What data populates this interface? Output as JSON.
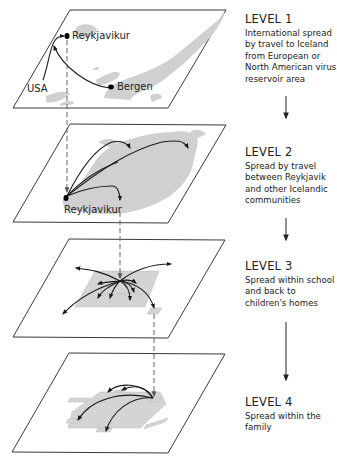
{
  "levels": [
    {
      "title": "LEVEL 1",
      "description": "International spread by travel to Iceland from European or North American virus reservoir area",
      "labels": {
        "reykjavik": "Reykjavikur",
        "usa": "USA",
        "bergen": "Bergen"
      }
    },
    {
      "title": "LEVEL 2",
      "description": "Spread by travel between Reykjavik and other Icelandic communities",
      "labels": {
        "reykjavik": "Reykjavikur"
      }
    },
    {
      "title": "LEVEL 3",
      "description": "Spread within school and back to children's homes"
    },
    {
      "title": "LEVEL 4",
      "description": "Spread within the family"
    }
  ],
  "colors": {
    "land": "#d0d0d0",
    "panel_border": "#3a3a3a",
    "flow_arrow": "#1a1a1a",
    "dashed_link": "#666666"
  }
}
